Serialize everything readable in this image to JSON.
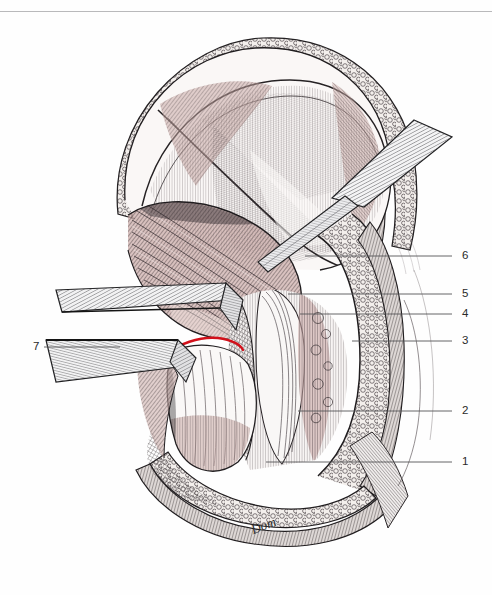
{
  "figure": {
    "domain": "anatomical line art",
    "background_color": "#ffffff",
    "top_rule_color": "#b9b9bb",
    "ink_color": "#1f1f1f",
    "muscle_tint": "#c9a9a6",
    "fat_tint": "#e9e4e0",
    "incision_color": "#d2101a",
    "signature": "Dom"
  },
  "labels": [
    {
      "id": "1",
      "text": "1",
      "x": 462,
      "y": 456,
      "line_from_x": 266,
      "line_to_x": 452,
      "line_y": 462
    },
    {
      "id": "2",
      "text": "2",
      "x": 462,
      "y": 405,
      "line_from_x": 298,
      "line_to_x": 452,
      "line_y": 411
    },
    {
      "id": "3",
      "text": "3",
      "x": 462,
      "y": 335,
      "line_from_x": 352,
      "line_to_x": 452,
      "line_y": 341
    },
    {
      "id": "4",
      "text": "4",
      "x": 462,
      "y": 308,
      "line_from_x": 300,
      "line_to_x": 452,
      "line_y": 314
    },
    {
      "id": "5",
      "text": "5",
      "x": 462,
      "y": 288,
      "line_from_x": 288,
      "line_to_x": 452,
      "line_y": 294
    },
    {
      "id": "6",
      "text": "6",
      "x": 462,
      "y": 250,
      "line_from_x": 305,
      "line_to_x": 452,
      "line_y": 256
    },
    {
      "id": "7",
      "text": "7",
      "x": 33,
      "y": 341,
      "line_from_x": 44,
      "line_to_x": 120,
      "line_y": 347
    }
  ],
  "leader_line_color": "#555557",
  "elements": {
    "retractor_upper_right": "surgical retractor blade entering from upper right",
    "retractor_left_upper": "broad retractor blade from left, upper",
    "retractor_left_lower": "retractor blade from left, lower",
    "incision_mark": "red curved incision marking",
    "wound_edge": "skin and subcutaneous fat wound margin",
    "muscle_mass": "retracted muscle belly",
    "deep_field": "deep surgical field with vessels"
  }
}
